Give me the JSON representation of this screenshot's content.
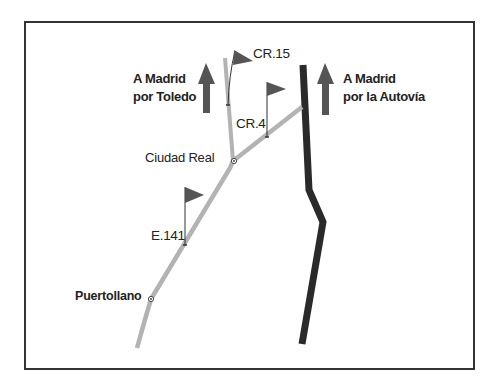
{
  "colors": {
    "frame": "#333333",
    "secondary_road": "#b3b3b3",
    "motorway": "#2a2a2a",
    "arrow": "#555555",
    "flag": "#555555",
    "text": "#222222"
  },
  "directions": {
    "left": {
      "line1": "A Madrid",
      "line2": "por Toledo",
      "icon": "arrow-up-icon"
    },
    "right": {
      "line1": "A Madrid",
      "line2": "por la Autovía",
      "icon": "arrow-up-icon"
    }
  },
  "towns": [
    {
      "name": "Ciudad Real"
    },
    {
      "name": "Puertollano"
    }
  ],
  "roads": [
    {
      "code": "CR.15",
      "icon": "flag-icon"
    },
    {
      "code": "CR.4",
      "icon": "flag-icon"
    },
    {
      "code": "E.141",
      "icon": "flag-icon"
    }
  ],
  "motorway": {
    "icon": "motorway-line"
  }
}
